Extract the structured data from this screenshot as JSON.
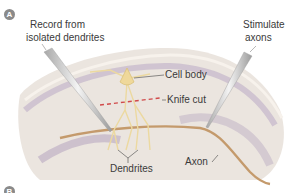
{
  "panels": [
    {
      "letter": "A"
    },
    {
      "letter": "B"
    }
  ],
  "labels": {
    "record": "Record from",
    "record2": "isolated dendrites",
    "stimulate": "Stimulate",
    "stimulate2": "axons",
    "cell_body": "Cell body",
    "knife_cut": "Knife cut",
    "dendrites": "Dendrites",
    "axon": "Axon"
  },
  "colors": {
    "tissue": "#ebe5df",
    "band": "#b9a9c2",
    "neuron": "#ecd9a0",
    "axon": "#c49a6c",
    "cut": "#d14a4a",
    "electrode": "#d8d8d8"
  }
}
